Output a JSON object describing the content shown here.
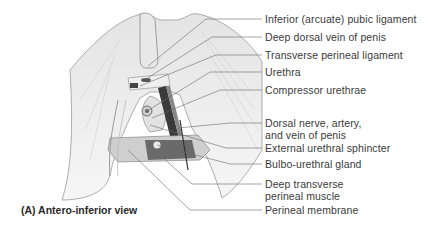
{
  "figure": {
    "caption": "(A) Antero-inferior view",
    "labels": [
      {
        "text": "Inferior (arcuate) pubic ligament",
        "y": 19
      },
      {
        "text": "Deep dorsal vein of penis",
        "y": 37
      },
      {
        "text": "Transverse perineal ligament",
        "y": 55
      },
      {
        "text": "Urethra",
        "y": 72
      },
      {
        "text": "Compressor urethrae",
        "y": 90
      },
      {
        "text": "Dorsal nerve, artery,",
        "text2": "and vein of penis",
        "y": 123
      },
      {
        "text": "External urethral sphincter",
        "y": 148
      },
      {
        "text": "Bulbo-urethral gland",
        "y": 164
      },
      {
        "text": "Deep transverse",
        "text2": "perineal muscle",
        "y": 184
      },
      {
        "text": "Perineal membrane",
        "y": 210
      }
    ]
  }
}
